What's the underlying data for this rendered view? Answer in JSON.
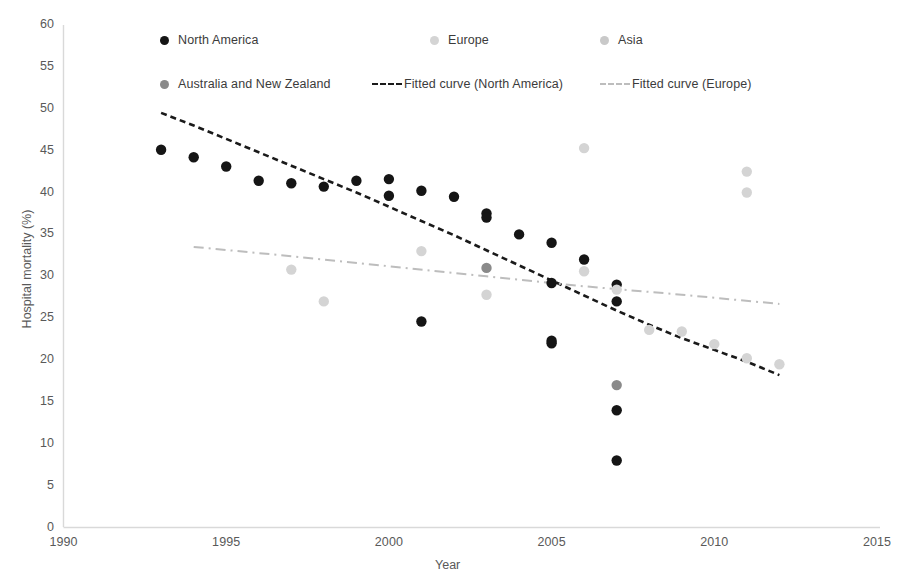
{
  "chart_data": {
    "type": "scatter",
    "title": "",
    "xlabel": "Year",
    "ylabel": "Hospital mortality (%)",
    "xlim": [
      1990,
      2015
    ],
    "ylim": [
      0,
      60
    ],
    "xticks": [
      "1990",
      "1995",
      "2000",
      "2005",
      "2010",
      "2015"
    ],
    "yticks": [
      "0",
      "5",
      "10",
      "15",
      "20",
      "25",
      "30",
      "35",
      "40",
      "45",
      "50",
      "55",
      "60"
    ],
    "grid": false,
    "legend_position": "top-inside",
    "series": [
      {
        "name": "North America",
        "marker": "circle",
        "color": "#151515",
        "points": [
          [
            1993,
            45.1
          ],
          [
            1994,
            44.2
          ],
          [
            1995,
            43.1
          ],
          [
            1996,
            41.4
          ],
          [
            1997,
            41.1
          ],
          [
            1998,
            40.7
          ],
          [
            1999,
            41.4
          ],
          [
            2000,
            41.6
          ],
          [
            2000,
            39.6
          ],
          [
            2001,
            40.2
          ],
          [
            2001,
            24.6
          ],
          [
            2002,
            39.5
          ],
          [
            2003,
            37.5
          ],
          [
            2003,
            37.0
          ],
          [
            2004,
            35.0
          ],
          [
            2005,
            34.0
          ],
          [
            2005,
            29.2
          ],
          [
            2005,
            22.3
          ],
          [
            2005,
            22.0
          ],
          [
            2006,
            32.0
          ],
          [
            2007,
            29.0
          ],
          [
            2007,
            27.0
          ],
          [
            2007,
            14.0
          ],
          [
            2007,
            8.0
          ]
        ]
      },
      {
        "name": "Europe",
        "marker": "circle",
        "color": "#d4d4d4",
        "points": [
          [
            1997,
            30.8
          ],
          [
            1998,
            27.0
          ],
          [
            2001,
            33.0
          ],
          [
            2003,
            27.8
          ],
          [
            2006,
            45.3
          ],
          [
            2006,
            30.6
          ],
          [
            2007,
            28.4
          ],
          [
            2008,
            23.6
          ],
          [
            2009,
            23.4
          ],
          [
            2010,
            21.9
          ],
          [
            2011,
            42.5
          ],
          [
            2011,
            40.0
          ],
          [
            2011,
            20.2
          ],
          [
            2012,
            19.5
          ]
        ]
      },
      {
        "name": "Asia",
        "marker": "circle",
        "color": "#c9c9c9",
        "points": []
      },
      {
        "name": "Australia and New Zealand",
        "marker": "circle",
        "color": "#8a8a8a",
        "points": [
          [
            2003,
            31.0
          ],
          [
            2007,
            17.0
          ]
        ]
      }
    ],
    "fits": [
      {
        "name": "Fitted curve (North America)",
        "style": "dashed",
        "color": "#1a1a1a",
        "path": [
          [
            1993,
            49.5
          ],
          [
            1994,
            48.0
          ],
          [
            1995,
            46.4
          ],
          [
            1996,
            44.8
          ],
          [
            1997,
            43.2
          ],
          [
            1998,
            41.6
          ],
          [
            1999,
            40.0
          ],
          [
            2000,
            38.3
          ],
          [
            2001,
            36.6
          ],
          [
            2002,
            34.9
          ],
          [
            2003,
            33.1
          ],
          [
            2004,
            31.3
          ],
          [
            2005,
            29.5
          ],
          [
            2006,
            27.7
          ],
          [
            2007,
            25.9
          ],
          [
            2008,
            24.2
          ],
          [
            2009,
            22.6
          ],
          [
            2010,
            21.2
          ],
          [
            2011,
            19.8
          ],
          [
            2012,
            18.2
          ]
        ]
      },
      {
        "name": "Fitted curve (Europe)",
        "style": "dash-dot",
        "color": "#bdbdbd",
        "path": [
          [
            1994,
            33.5
          ],
          [
            1997,
            32.4
          ],
          [
            2000,
            31.2
          ],
          [
            2003,
            30.0
          ],
          [
            2006,
            28.8
          ],
          [
            2009,
            27.8
          ],
          [
            2012,
            26.7
          ]
        ]
      }
    ]
  },
  "legend": {
    "items": [
      {
        "label": "North America",
        "type": "marker",
        "color": "#151515"
      },
      {
        "label": "Europe",
        "type": "marker",
        "color": "#d4d4d4"
      },
      {
        "label": "Asia",
        "type": "marker",
        "color": "#c9c9c9"
      },
      {
        "label": "Australia and New Zealand",
        "type": "marker",
        "color": "#8a8a8a"
      },
      {
        "label": "Fitted curve (North America)",
        "type": "line-dashed",
        "color": "#1a1a1a"
      },
      {
        "label": "Fitted curve (Europe)",
        "type": "line-dashdot",
        "color": "#bdbdbd"
      }
    ]
  },
  "axes": {
    "y_title": "Hospital mortality (%)",
    "x_title": "Year",
    "yticks": [
      "60",
      "55",
      "50",
      "45",
      "40",
      "35",
      "30",
      "25",
      "20",
      "15",
      "10",
      "5",
      "0"
    ],
    "xticks": [
      "1990",
      "1995",
      "2000",
      "2005",
      "2010",
      "2015"
    ]
  }
}
